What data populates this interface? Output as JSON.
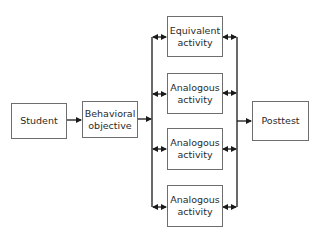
{
  "diagram": {
    "nodes": {
      "student": {
        "label": "Student"
      },
      "objective": {
        "line1": "Behavioral",
        "line2": "objective"
      },
      "activity1": {
        "line1": "Equivalent",
        "line2": "activity"
      },
      "activity2": {
        "line1": "Analogous",
        "line2": "activity"
      },
      "activity3": {
        "line1": "Analogous",
        "line2": "activity"
      },
      "activity4": {
        "line1": "Analogous",
        "line2": "activity"
      },
      "posttest": {
        "label": "Posttest"
      }
    },
    "edges": [
      {
        "from": "Student",
        "to": "Behavioral objective",
        "type": "arrow"
      },
      {
        "from": "Behavioral objective",
        "to": "activities",
        "type": "arrow"
      },
      {
        "from": "Equivalent activity",
        "to": "bus",
        "type": "bidirectional"
      },
      {
        "from": "Analogous activity",
        "to": "bus",
        "type": "bidirectional"
      },
      {
        "from": "Analogous activity",
        "to": "bus",
        "type": "bidirectional"
      },
      {
        "from": "Analogous activity",
        "to": "bus",
        "type": "bidirectional"
      },
      {
        "from": "activities",
        "to": "Posttest",
        "type": "arrow"
      }
    ],
    "colors": {
      "line": "#1a1a1a",
      "border": "#6e6e6e",
      "text": "#2a2a2a"
    }
  }
}
